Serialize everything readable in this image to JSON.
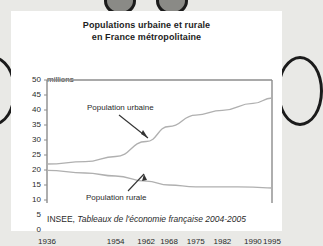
{
  "figure": {
    "title_line1": "Populations urbaine et rurale",
    "title_line2": "en France métropolitaine",
    "units_label": "millions",
    "source_prefix": "INSEE, ",
    "source_italic": "Tableaux de l'économie française 2004-2005"
  },
  "annotations": {
    "urbaine": "Population urbaine",
    "rurale": "Population rurale"
  },
  "chart_data": {
    "type": "line",
    "title": "Populations urbaine et rurale en France métropolitaine",
    "xlabel": "",
    "ylabel": "millions",
    "ylim": [
      0,
      50
    ],
    "xlim": [
      1936,
      1995
    ],
    "yticks": [
      0,
      5,
      10,
      15,
      20,
      25,
      30,
      35,
      40,
      45,
      50
    ],
    "ytick_labels": [
      "0",
      "5",
      "10",
      "15",
      "20",
      "25",
      "30",
      "35",
      "40",
      "45",
      "50"
    ],
    "xticks": [
      1936,
      1954,
      1962,
      1968,
      1975,
      1982,
      1990,
      1995
    ],
    "xtick_labels": [
      "1936",
      "1954",
      "1962",
      "1968",
      "1975",
      "1982",
      "1990",
      "1995"
    ],
    "grid": false,
    "legend": "annotated-inline",
    "line_color": "#b0b0b0",
    "series": [
      {
        "name": "Population urbaine",
        "x": [
          1936,
          1946,
          1954,
          1962,
          1968,
          1975,
          1982,
          1990,
          1995
        ],
        "values": [
          22.0,
          22.8,
          24.5,
          29.5,
          34.5,
          38.3,
          39.9,
          42.2,
          44.0
        ]
      },
      {
        "name": "Population rurale",
        "x": [
          1936,
          1946,
          1954,
          1962,
          1968,
          1975,
          1982,
          1990,
          1995
        ],
        "values": [
          19.9,
          19.0,
          18.0,
          16.3,
          15.0,
          14.4,
          14.4,
          14.3,
          14.0
        ]
      }
    ]
  },
  "colors": {
    "page_background": "#e9e9e6",
    "card_background": "#ffffff",
    "axis": "#8c8c8c",
    "text": "#2a2a2a",
    "decoration": "#1b1b1b"
  }
}
